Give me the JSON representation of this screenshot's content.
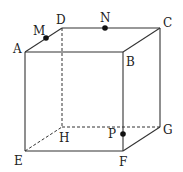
{
  "diagram": {
    "type": "cube",
    "vertices": {
      "A": {
        "label": "A",
        "x": 25,
        "y": 52
      },
      "B": {
        "label": "B",
        "x": 123,
        "y": 52
      },
      "C": {
        "label": "C",
        "x": 160,
        "y": 28
      },
      "D": {
        "label": "D",
        "x": 62,
        "y": 28
      },
      "E": {
        "label": "E",
        "x": 25,
        "y": 151
      },
      "F": {
        "label": "F",
        "x": 123,
        "y": 151
      },
      "G": {
        "label": "G",
        "x": 160,
        "y": 127
      },
      "H": {
        "label": "H",
        "x": 62,
        "y": 127
      }
    },
    "points": {
      "M": {
        "label": "M",
        "on_edge": "AD",
        "x": 46,
        "y": 38
      },
      "N": {
        "label": "N",
        "on_edge": "DC",
        "x": 105,
        "y": 28
      },
      "P": {
        "label": "P",
        "on_edge": "BF",
        "x": 123,
        "y": 134
      }
    },
    "visible_edges": [
      "AB",
      "BC",
      "CD",
      "DA",
      "AE",
      "BF",
      "CG",
      "EF",
      "FG"
    ],
    "hidden_edges": [
      "DH",
      "EH",
      "HG"
    ]
  }
}
